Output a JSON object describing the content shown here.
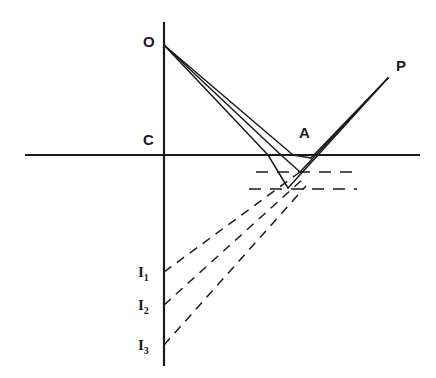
{
  "figure": {
    "type": "optics-ray-diagram",
    "background_color": "#ffffff",
    "line_color": "#1a1a1a",
    "axes": {
      "vertical": {
        "x": 164,
        "y1": 22,
        "y2": 366,
        "label": ""
      },
      "horizontal": {
        "y": 155,
        "x1": 25,
        "x2": 420,
        "label": ""
      }
    },
    "labels": {
      "object_point": "O",
      "center_point": "C",
      "surface_point": "A",
      "image_point_p": "P",
      "image_1": "I",
      "image_1_sub": "1",
      "image_2": "I",
      "image_2_sub": "2",
      "image_3": "I",
      "image_3_sub": "3"
    },
    "points": {
      "O": {
        "x": 164,
        "y": 45
      },
      "C": {
        "x": 164,
        "y": 155
      },
      "A": {
        "x": 297,
        "y": 155
      },
      "P": {
        "x": 388,
        "y": 78
      },
      "I1": {
        "x": 164,
        "y": 272
      },
      "I2": {
        "x": 164,
        "y": 305
      },
      "I3": {
        "x": 164,
        "y": 345
      }
    },
    "rays_from_object": [
      {
        "name": "ray-1-steep",
        "from": [
          164,
          45
        ],
        "to": [
          268,
          155
        ]
      },
      {
        "name": "ray-2-middle",
        "from": [
          164,
          45
        ],
        "to": [
          281,
          155
        ]
      },
      {
        "name": "ray-3-shallow",
        "from": [
          164,
          45
        ],
        "to": [
          293,
          155
        ]
      }
    ],
    "rays_to_image": [
      {
        "name": "ray-1-out",
        "from": [
          288,
          188
        ],
        "to": [
          388,
          78
        ]
      },
      {
        "name": "ray-2-out",
        "from": [
          300,
          172
        ],
        "to": [
          388,
          78
        ]
      },
      {
        "name": "ray-3-out",
        "from": [
          311,
          158
        ],
        "to": [
          388,
          78
        ]
      }
    ],
    "refraction_segments": [
      {
        "name": "seg-1",
        "from": [
          268,
          155
        ],
        "to": [
          288,
          188
        ]
      },
      {
        "name": "seg-2",
        "from": [
          281,
          155
        ],
        "to": [
          300,
          172
        ]
      },
      {
        "name": "seg-3",
        "from": [
          293,
          155
        ],
        "to": [
          311,
          158
        ]
      }
    ],
    "dashed_horizontals": [
      {
        "name": "dashed-level-1",
        "y": 172,
        "x1": 256,
        "x2": 357
      },
      {
        "name": "dashed-level-2",
        "y": 189,
        "x1": 249,
        "x2": 357
      }
    ],
    "virtual_rays": [
      {
        "name": "virtual-ray-1",
        "from": [
          164,
          272
        ],
        "to": [
          300,
          172
        ]
      },
      {
        "name": "virtual-ray-2",
        "from": [
          164,
          305
        ],
        "to": [
          302,
          180
        ]
      },
      {
        "name": "virtual-ray-3",
        "from": [
          164,
          345
        ],
        "to": [
          305,
          186
        ]
      }
    ]
  }
}
